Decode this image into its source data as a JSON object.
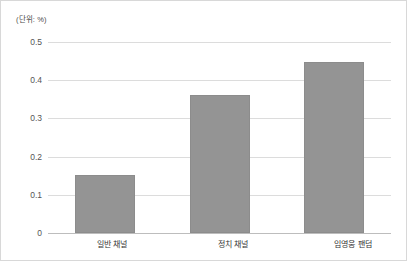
{
  "unit_note": "(단위: %)",
  "chart_data": {
    "type": "bar",
    "title": "",
    "subtitle": "",
    "xlabel": "",
    "ylabel": "",
    "unit_note": "(단위: %)",
    "categories": [
      "일반 채널",
      "정치 채널",
      "임영웅 팬덤"
    ],
    "values": [
      0.152,
      0.36,
      0.448
    ],
    "series": [
      {
        "name": "",
        "values": [
          0.152,
          0.36,
          0.448
        ]
      }
    ],
    "ylim": [
      0,
      0.5
    ],
    "yticks": [
      0,
      0.1,
      0.2,
      0.3,
      0.4,
      0.5
    ],
    "ytick_labels": [
      "0",
      "0.1",
      "0.2",
      "0.3",
      "0.4",
      "0.5"
    ],
    "grid": true,
    "grid_axis": "y",
    "legend": false,
    "legend_position": "none",
    "bar_color": "#949494",
    "grid_color": "#dcdcdc",
    "axis_color": "#bdbdbd",
    "background": "#ffffff",
    "annotations": []
  }
}
